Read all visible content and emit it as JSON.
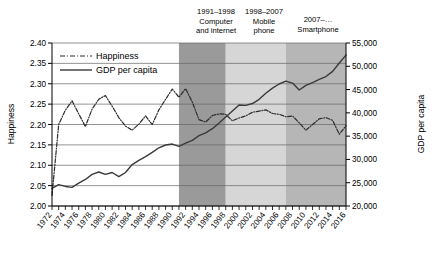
{
  "chart_data": {
    "type": "line",
    "title": "",
    "xlabel": "",
    "ylabel": "Happiness",
    "y2label": "GDP per capita",
    "xlim": [
      1972,
      2016
    ],
    "ylim": [
      2.0,
      2.4
    ],
    "y2lim": [
      20000,
      55000
    ],
    "grid": true,
    "legend_position": "top-left",
    "x_ticks": [
      1972,
      1974,
      1976,
      1978,
      1980,
      1982,
      1984,
      1986,
      1988,
      1990,
      1992,
      1994,
      1996,
      1998,
      2000,
      2002,
      2004,
      2006,
      2008,
      2010,
      2012,
      2014,
      2016
    ],
    "x_tick_labels": [
      "1972",
      "1974",
      "1976",
      "1978",
      "1980",
      "1982",
      "1984",
      "1986",
      "1988",
      "1990",
      "1992",
      "1994",
      "1996",
      "1998",
      "2000",
      "2002",
      "2004",
      "2006",
      "2008",
      "2010",
      "2012",
      "2014",
      "2016"
    ],
    "y_ticks": [
      2.0,
      2.05,
      2.1,
      2.15,
      2.2,
      2.25,
      2.3,
      2.35,
      2.4
    ],
    "y_tick_labels": [
      "2.00",
      "2.05",
      "2.10",
      "2.15",
      "2.20",
      "2.25",
      "2.30",
      "2.35",
      "2.40"
    ],
    "y2_ticks": [
      20000,
      25000,
      30000,
      35000,
      40000,
      45000,
      50000,
      55000
    ],
    "y2_tick_labels": [
      "20,000",
      "25,000",
      "30,000",
      "35,000",
      "40,000",
      "45,000",
      "50,000",
      "55,000"
    ],
    "x": [
      1972,
      1973,
      1974,
      1975,
      1976,
      1977,
      1978,
      1979,
      1980,
      1981,
      1982,
      1983,
      1984,
      1985,
      1986,
      1987,
      1988,
      1989,
      1990,
      1991,
      1992,
      1993,
      1994,
      1995,
      1996,
      1997,
      1998,
      1999,
      2000,
      2001,
      2002,
      2003,
      2004,
      2005,
      2006,
      2007,
      2008,
      2009,
      2010,
      2011,
      2012,
      2013,
      2014,
      2015,
      2016
    ],
    "series": [
      {
        "name": "Happiness",
        "axis": "left",
        "style": "dash-dot",
        "color": "#2b2b2b",
        "values": [
          2.026,
          2.2,
          2.235,
          2.258,
          2.226,
          2.195,
          2.238,
          2.262,
          2.271,
          2.245,
          2.217,
          2.196,
          2.186,
          2.201,
          2.221,
          2.2,
          2.236,
          2.262,
          2.287,
          2.267,
          2.288,
          2.255,
          2.212,
          2.206,
          2.222,
          2.226,
          2.225,
          2.209,
          2.216,
          2.221,
          2.23,
          2.233,
          2.236,
          2.227,
          2.225,
          2.219,
          2.221,
          2.204,
          2.186,
          2.2,
          2.214,
          2.217,
          2.21,
          2.176,
          2.197
        ]
      },
      {
        "name": "GDP per capita",
        "axis": "right",
        "style": "solid",
        "color": "#3a3a3a",
        "values": [
          23800,
          24600,
          24200,
          24000,
          24900,
          25700,
          26800,
          27300,
          26800,
          27200,
          26300,
          27200,
          28900,
          29800,
          30600,
          31500,
          32500,
          33100,
          33300,
          32800,
          33500,
          34100,
          35100,
          35700,
          36600,
          37800,
          39100,
          40400,
          41700,
          41600,
          42000,
          42900,
          44200,
          45300,
          46200,
          46800,
          46400,
          44900,
          45900,
          46500,
          47200,
          47800,
          48900,
          50700,
          52400
        ]
      }
    ],
    "annotations": [
      {
        "name": "computer-and-internet",
        "period": "1991–1998",
        "label_line1": "Computer",
        "label_line2": "and internet",
        "x_start": 1991,
        "x_end": 1998,
        "shade_color": "#9a9a9a"
      },
      {
        "name": "mobile-phone",
        "period": "1998–2007",
        "label_line1": "Mobile",
        "label_line2": "phone",
        "x_start": 1998,
        "x_end": 2007,
        "shade_color": "#d6d6d6"
      },
      {
        "name": "smartphone",
        "period": "2007–…",
        "label_line1": "Smartphone",
        "label_line2": "",
        "x_start": 2007,
        "x_end": 2016,
        "shade_color": "#b6b6b6"
      }
    ],
    "legend": [
      {
        "name": "Happiness",
        "style": "dash-dot"
      },
      {
        "name": "GDP per capita",
        "style": "solid"
      }
    ]
  }
}
